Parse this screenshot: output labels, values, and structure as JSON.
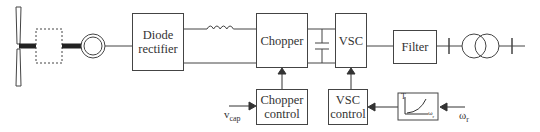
{
  "diagram": {
    "blocks": {
      "gearbox": {
        "label": ""
      },
      "diode_rectifier": {
        "label": "Diode rectifier"
      },
      "chopper": {
        "label": "Chopper"
      },
      "vsc": {
        "label": "VSC"
      },
      "filter": {
        "label": "Filter"
      },
      "chopper_control": {
        "label": "Chopper control"
      },
      "vsc_control": {
        "label": "VSC control"
      },
      "mppt_curve": {
        "y_label": "T",
        "x_label": "ω",
        "x_sub": "r"
      }
    },
    "inputs": {
      "vcap": {
        "main": "v",
        "sub": "cap"
      },
      "omega_r": {
        "main": "ω",
        "sub": "r"
      }
    },
    "components": [
      "wind-turbine",
      "gearbox",
      "generator",
      "diode-rectifier",
      "inductor",
      "chopper",
      "dc-link-capacitor",
      "vsc",
      "filter",
      "transformer",
      "grid"
    ],
    "colors": {
      "line": "#444444",
      "background": "#ffffff"
    }
  }
}
